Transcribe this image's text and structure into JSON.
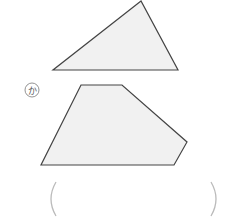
{
  "figures": {
    "triangle": {
      "points": "141,1 53,70 178,70",
      "fill": "#f1f1f1",
      "stroke": "#444444"
    },
    "pentagon": {
      "label": "か",
      "points": "81,85 122,85 187,142 174,165 41,165",
      "fill": "#f1f1f1",
      "stroke": "#444444"
    }
  },
  "answer_box": {
    "open": "(",
    "close": ")",
    "value": ""
  }
}
